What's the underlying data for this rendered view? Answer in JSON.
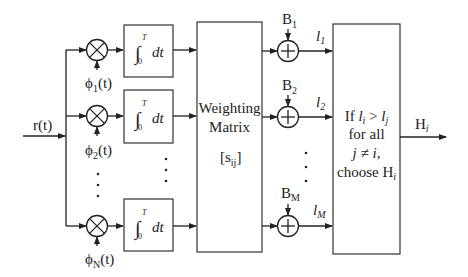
{
  "diagram": {
    "input": {
      "label": "r(t)"
    },
    "branches": [
      {
        "multiplier_label": "ϕ",
        "multiplier_sub": "1",
        "multiplier_suffix": "(t)"
      },
      {
        "multiplier_label": "ϕ",
        "multiplier_sub": "2",
        "multiplier_suffix": "(t)"
      },
      {
        "multiplier_label": "ϕ",
        "multiplier_sub": "N",
        "multiplier_suffix": "(t)"
      }
    ],
    "integrator": {
      "upper_limit": "T",
      "lower_limit": "0",
      "body": "dt",
      "integral_sign": "∫"
    },
    "ellipsis": "⋮",
    "weighting": {
      "line1": "Weighting",
      "line2": "Matrix",
      "symbol": "[s",
      "symbol_sub": "ij",
      "symbol_close": "]"
    },
    "adders": [
      {
        "bias": "B",
        "bias_sub": "1",
        "output": "l",
        "output_sub": "1"
      },
      {
        "bias": "B",
        "bias_sub": "2",
        "output": "l",
        "output_sub": "2"
      },
      {
        "bias": "B",
        "bias_sub": "M",
        "output": "l",
        "output_sub": "M"
      }
    ],
    "decision": {
      "line1_a": "If ",
      "line1_b": "l",
      "line1_b_sub": "i",
      "line1_c": " > ",
      "line1_d": "l",
      "line1_d_sub": "j",
      "line2": "for all",
      "line3": "j ≠ i,",
      "line4": "choose H",
      "line4_sub": "i"
    },
    "output": {
      "label": "H",
      "label_sub": "i"
    }
  }
}
